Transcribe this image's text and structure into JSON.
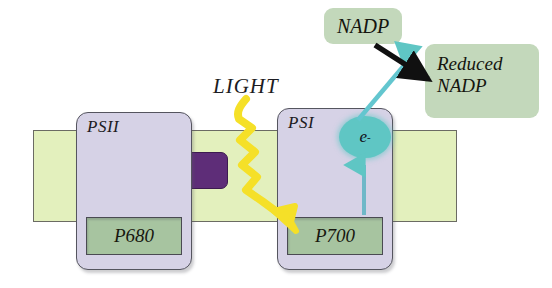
{
  "diagram": {
    "membrane": {
      "name": "thylakoid-membrane",
      "color": "#e3f0bd"
    },
    "complex": {
      "name": "electron-transport-complex",
      "color": "#5e2d78"
    },
    "photosystems": [
      {
        "label": "PSII",
        "pigment": "P680",
        "color": "#d6d2e6",
        "pigment_color": "#a7c4a0"
      },
      {
        "label": "PSI",
        "pigment": "P700",
        "color": "#d6d2e6",
        "pigment_color": "#a7c4a0"
      }
    ],
    "light": {
      "label": "LIGHT",
      "arrow_color": "#f5e028"
    },
    "electron": {
      "label": "e",
      "charge": "-",
      "color": "#5fc6c4"
    },
    "nadp": {
      "label": "NADP",
      "color": "#c3d8bb"
    },
    "reduced_nadp": {
      "line1": "Reduced",
      "line2": "NADP",
      "color": "#c3d8bb"
    },
    "arrows": {
      "electron_transfer_color": "#5fc6c4",
      "reduction_color": "#101010"
    }
  }
}
